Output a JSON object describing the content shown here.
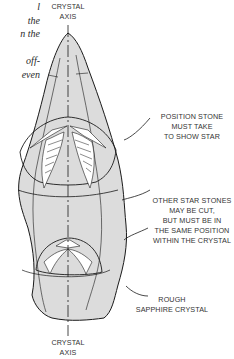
{
  "text_fragment": {
    "lines": [
      "l",
      "the",
      "n the",
      "",
      "off-",
      "even"
    ]
  },
  "labels": {
    "axis_top": [
      "CRYSTAL",
      "AXIS"
    ],
    "position_stone": [
      "POSITION STONE",
      "MUST TAKE",
      "TO SHOW STAR"
    ],
    "other_star": [
      "OTHER STAR STONES",
      "MAY BE CUT,",
      "BUT MUST BE IN",
      "THE SAME POSITION",
      "WITHIN THE CRYSTAL"
    ],
    "rough": [
      "ROUGH",
      "SAPPHIRE CRYSTAL"
    ],
    "axis_bottom": [
      "CRYSTAL",
      "AXIS"
    ]
  },
  "colors": {
    "crystal_fill": "#dcdcdc",
    "stroke": "#1a1a1a"
  }
}
